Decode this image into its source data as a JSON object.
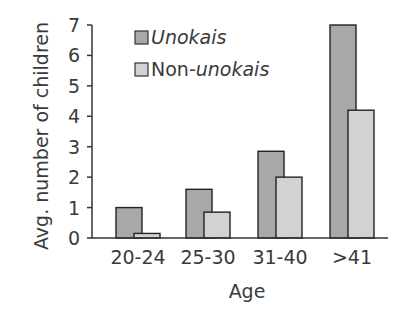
{
  "chart_data": {
    "type": "bar",
    "title": "",
    "xlabel": "Age",
    "ylabel": "Avg. number of children",
    "categories": [
      "20-24",
      "25-30",
      "31-40",
      ">41"
    ],
    "series": [
      {
        "name": "Unokais",
        "italic": true,
        "color": "#a8a8a8",
        "values": [
          1.0,
          1.6,
          2.85,
          7.0
        ]
      },
      {
        "name": "Non-unokais",
        "name_plain": "Non-",
        "name_italic": "unokais",
        "color": "#d2d2d2",
        "values": [
          0.15,
          0.85,
          2.0,
          4.2
        ]
      }
    ],
    "ylim": [
      0,
      7
    ],
    "yticks": [
      0,
      1,
      2,
      3,
      4,
      5,
      6,
      7
    ],
    "grid": false,
    "legend_position": "top-left inside"
  },
  "legend": {
    "item1_label": "Unokais",
    "item2_plain": "Non-",
    "item2_italic": "unokais"
  },
  "axes": {
    "x_title": "Age",
    "y_title": "Avg. number of children"
  }
}
